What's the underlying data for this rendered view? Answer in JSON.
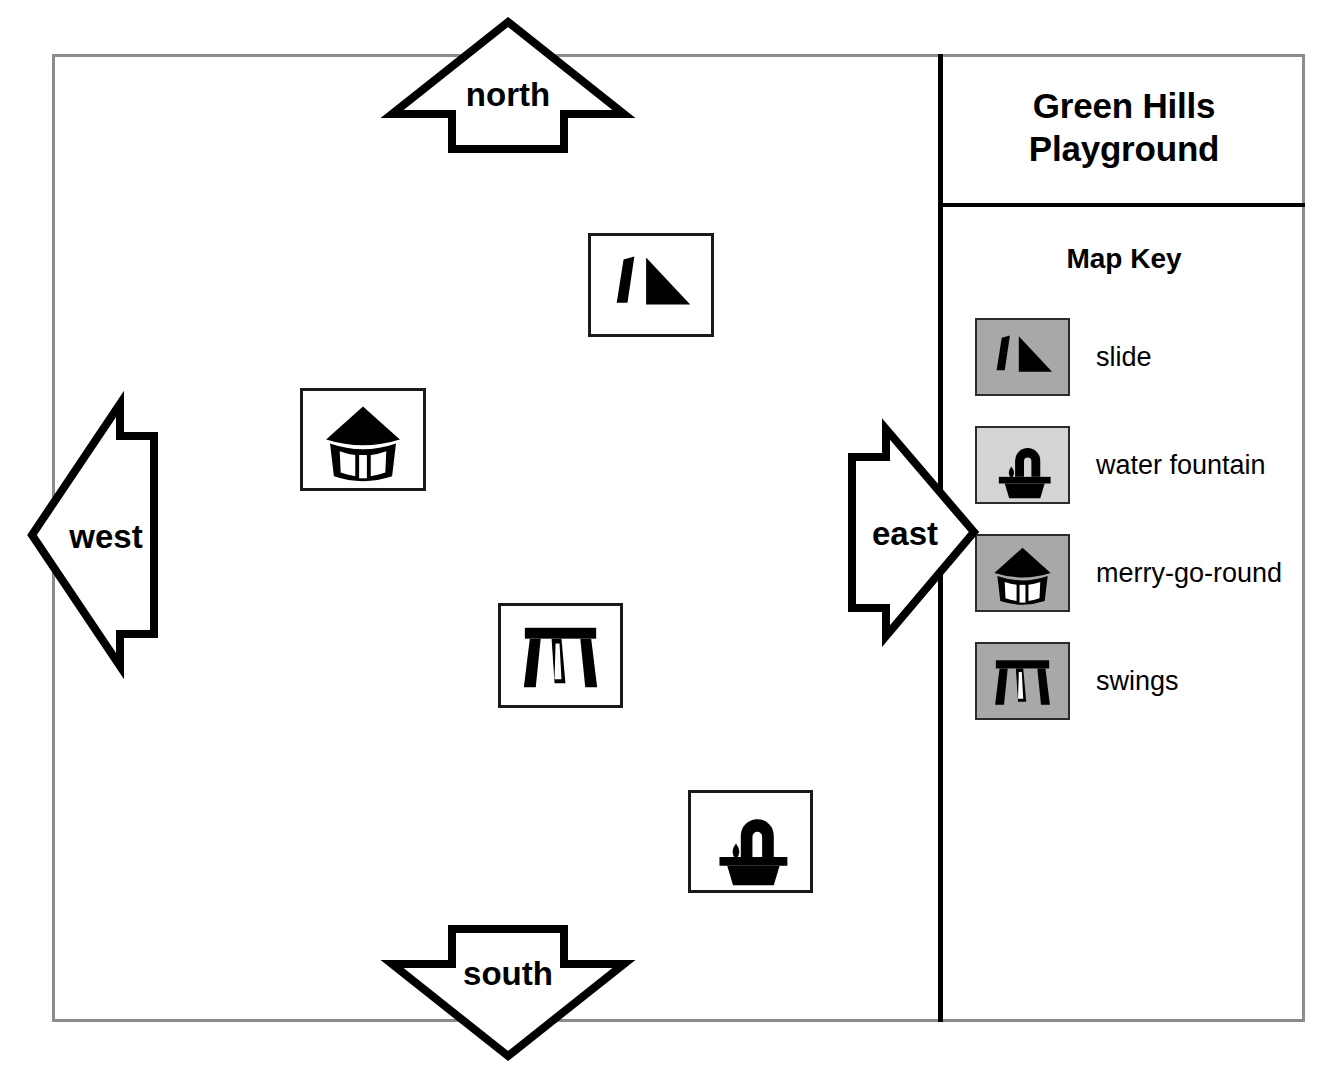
{
  "map": {
    "title_line1": "Green Hills",
    "title_line2": "Playground",
    "key_heading": "Map Key",
    "frame_color": "#8c8c8c",
    "divider_color": "#000000"
  },
  "compass": {
    "north": "north",
    "south": "south",
    "west": "west",
    "east": "east"
  },
  "legend": {
    "items": [
      {
        "label": "slide",
        "icon": "slide-icon",
        "swatch_color": "#a8a8a8"
      },
      {
        "label": "water  fountain",
        "icon": "water-fountain-icon",
        "swatch_color": "#d4d4d4"
      },
      {
        "label": "merry-go-round",
        "icon": "merry-go-round-icon",
        "swatch_color": "#a8a8a8"
      },
      {
        "label": "swings",
        "icon": "swings-icon",
        "swatch_color": "#a8a8a8"
      }
    ]
  },
  "map_symbols": [
    {
      "name": "slide",
      "icon": "slide-icon",
      "x": 588,
      "y": 233,
      "w": 126,
      "h": 104
    },
    {
      "name": "merry-go-round",
      "icon": "merry-go-round-icon",
      "x": 300,
      "y": 388,
      "w": 126,
      "h": 103
    },
    {
      "name": "swings",
      "icon": "swings-icon",
      "x": 498,
      "y": 603,
      "w": 125,
      "h": 105
    },
    {
      "name": "water fountain",
      "icon": "water-fountain-icon",
      "x": 688,
      "y": 790,
      "w": 125,
      "h": 103
    }
  ]
}
